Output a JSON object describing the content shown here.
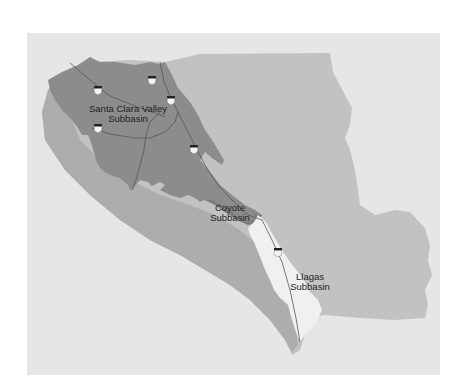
{
  "map": {
    "title": "",
    "regions": [
      {
        "id": "county",
        "name": "Santa Clara County",
        "fill": "#c2c2c2"
      },
      {
        "id": "west-hills",
        "name": "Western hills band",
        "fill": "#a9a9a9"
      },
      {
        "id": "santa-clara-valley",
        "name": "Santa Clara Valley Subbasin",
        "fill": "#8e8e8e"
      },
      {
        "id": "coyote",
        "name": "Coyote Subbasin",
        "fill": "#7f7f7f"
      },
      {
        "id": "llagas",
        "name": "Llagas Subbasin",
        "fill": "#f0f0f0"
      }
    ],
    "labels": {
      "santa_clara_line1": "Santa Clara Valley",
      "santa_clara_line2": "Subbasin",
      "coyote_line1": "Coyote",
      "coyote_line2": "Subbasin",
      "llagas_line1": "Llagas",
      "llagas_line2": "Subbasin"
    },
    "highway_shields": [
      {
        "x": 98,
        "y": 90
      },
      {
        "x": 152,
        "y": 80
      },
      {
        "x": 171,
        "y": 100
      },
      {
        "x": 98,
        "y": 128
      },
      {
        "x": 194,
        "y": 149
      },
      {
        "x": 278,
        "y": 252
      }
    ],
    "colors": {
      "background": "#e6e6e6",
      "road": "#555555",
      "shield_top": "#222222",
      "shield_body": "#f4f4f4"
    }
  }
}
